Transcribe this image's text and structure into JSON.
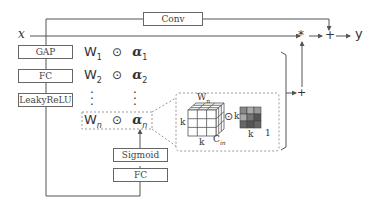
{
  "input_label": "x",
  "output_label": "y",
  "conv_label": "Conv",
  "left_stack": [
    "GAP",
    "FC",
    "LeakyReLU"
  ],
  "bottom_stack": [
    "Sigmoid",
    "FC"
  ],
  "rows": [
    {
      "w": "W",
      "w_sub": "1",
      "op": "⊙",
      "a": "α",
      "a_sub": "1"
    },
    {
      "w": "W",
      "w_sub": "2",
      "op": "⊙",
      "a": "α",
      "a_sub": "2"
    },
    {
      "w": "W",
      "w_sub": "n",
      "op": "⊙",
      "a": "α",
      "a_sub": "n"
    }
  ],
  "detail": {
    "w_label": "W",
    "w_sub": "n",
    "k_left": "k",
    "k_bottom": "k",
    "cin": "C",
    "cin_sub": "in",
    "op": "⊙",
    "k_right": "k",
    "k_bottom2": "k",
    "one": "1"
  },
  "plus": "+",
  "multiply": "*",
  "colors": {
    "line": "#555555",
    "dashed": "#999999",
    "cube_fill": "#ffffff",
    "grid_dark": "#555555",
    "grid_mid": "#888888",
    "grid_light": "#aaaaaa"
  }
}
